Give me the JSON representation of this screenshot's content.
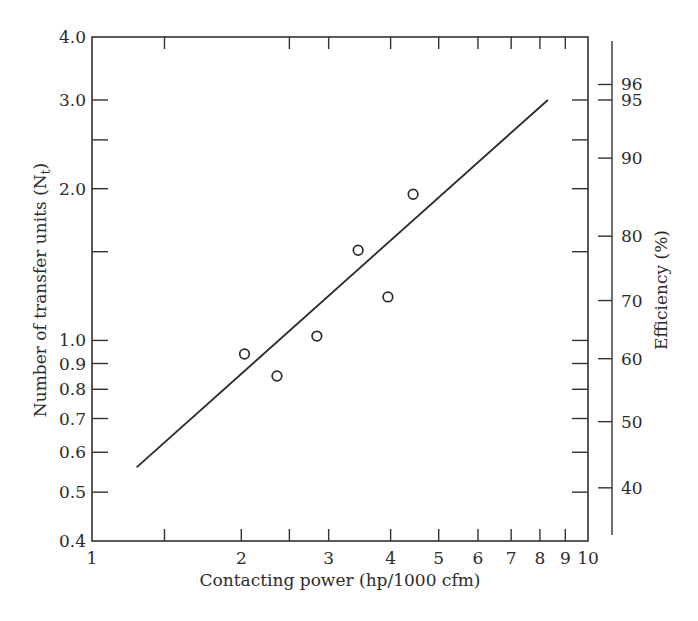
{
  "chart_data": {
    "type": "scatter",
    "title": "",
    "xlabel": "Contacting  power (hp/1000  cfm)",
    "ylabel": "Number of transfer units (N",
    "ylabel_sub": "t",
    "ylabel_close": ")",
    "y2label": "Efficiency (%)",
    "xscale": "log",
    "yscale": "log",
    "xlim": [
      1,
      10
    ],
    "ylim": [
      0.4,
      4.0
    ],
    "grid": false,
    "x_ticks": [
      {
        "value": 1,
        "label": "1"
      },
      {
        "value": 2,
        "label": "2"
      },
      {
        "value": 3,
        "label": "3"
      },
      {
        "value": 4,
        "label": "4"
      },
      {
        "value": 5,
        "label": "5"
      },
      {
        "value": 6,
        "label": "6"
      },
      {
        "value": 7,
        "label": "7"
      },
      {
        "value": 8,
        "label": "8"
      },
      {
        "value": 9,
        "label": "9"
      },
      {
        "value": 10,
        "label": "10"
      }
    ],
    "x_minor_ticks": [
      1.4,
      2.5
    ],
    "y_ticks": [
      {
        "value": 4.0,
        "label": "4.0"
      },
      {
        "value": 3.0,
        "label": "3.0"
      },
      {
        "value": 2.0,
        "label": "2.0"
      },
      {
        "value": 1.0,
        "label": "1.0"
      },
      {
        "value": 0.9,
        "label": "0.9"
      },
      {
        "value": 0.8,
        "label": "0.8"
      },
      {
        "value": 0.7,
        "label": "0.7"
      },
      {
        "value": 0.6,
        "label": "0.6"
      },
      {
        "value": 0.5,
        "label": "0.5"
      },
      {
        "value": 0.4,
        "label": "0.4"
      }
    ],
    "y_minor_ticks": [
      2.5,
      1.5
    ],
    "y2_ticks": [
      {
        "label": "96",
        "ntu": 3.22
      },
      {
        "label": "95",
        "ntu": 3.0
      },
      {
        "label": "90",
        "ntu": 2.3
      },
      {
        "label": "80",
        "ntu": 1.61
      },
      {
        "label": "70",
        "ntu": 1.2
      },
      {
        "label": "60",
        "ntu": 0.92
      },
      {
        "label": "50",
        "ntu": 0.69
      },
      {
        "label": "40",
        "ntu": 0.51
      }
    ],
    "series": [
      {
        "name": "Measured data",
        "marker": "open-circle",
        "x": [
          2.03,
          2.36,
          2.84,
          3.44,
          3.95,
          4.44
        ],
        "y": [
          0.94,
          0.85,
          1.02,
          1.51,
          1.22,
          1.95
        ]
      },
      {
        "name": "Fitted line",
        "marker": "line",
        "x": [
          1.23,
          8.3
        ],
        "y": [
          0.56,
          3.0
        ]
      }
    ]
  }
}
